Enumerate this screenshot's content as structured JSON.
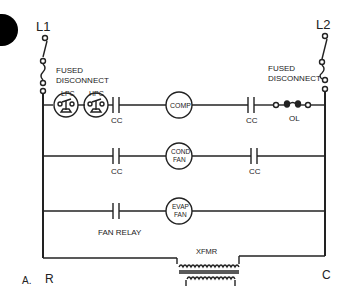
{
  "diagram": {
    "type": "ladder-wiring-diagram",
    "figure_label": "A.",
    "lines": {
      "left": "L1",
      "right": "L2"
    },
    "disconnects": {
      "left": [
        "FUSED",
        "DISCONNECT"
      ],
      "right": [
        "FUSED",
        "DISCONNECT"
      ]
    },
    "rungs": [
      {
        "name": "compressor",
        "components": [
          {
            "id": "lpc",
            "label": "LPC",
            "kind": "pressure-switch"
          },
          {
            "id": "hpc",
            "label": "HPC",
            "kind": "pressure-switch"
          },
          {
            "id": "cc1",
            "label": "CC",
            "kind": "contact-no"
          },
          {
            "id": "comp",
            "label": "COMP",
            "kind": "load"
          },
          {
            "id": "cc2",
            "label": "CC",
            "kind": "contact-no"
          },
          {
            "id": "ol",
            "label": "OL",
            "kind": "overload"
          }
        ]
      },
      {
        "name": "condenser-fan",
        "components": [
          {
            "id": "cc3",
            "label": "CC",
            "kind": "contact-no"
          },
          {
            "id": "condfan",
            "label": [
              "COND",
              "FAN"
            ],
            "kind": "load"
          },
          {
            "id": "cc4",
            "label": "CC",
            "kind": "contact-no"
          }
        ]
      },
      {
        "name": "evaporator-fan",
        "components": [
          {
            "id": "fanrelay",
            "label": "FAN RELAY",
            "kind": "contact-no"
          },
          {
            "id": "evapfan",
            "label": [
              "EVAP",
              "FAN"
            ],
            "kind": "load"
          }
        ]
      }
    ],
    "transformer": {
      "label": "XFMR"
    },
    "terminals": {
      "left": "R",
      "right": "C"
    }
  }
}
